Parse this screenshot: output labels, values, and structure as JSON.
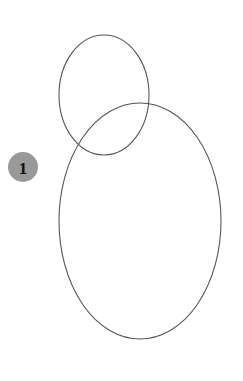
{
  "canvas": {
    "width": 243,
    "height": 381,
    "background_color": "#ffffff"
  },
  "style": {
    "outline_color": "#555555",
    "outline_width": 1.1,
    "marker_fill_color": "#999999",
    "marker_text_color": "#111111"
  },
  "shapes": [
    {
      "name": "small-ellipse",
      "type": "ellipse",
      "cx": 104,
      "cy": 95,
      "rx": 45,
      "ry": 60,
      "fill": "none",
      "stroke": "#555555"
    },
    {
      "name": "large-ellipse",
      "type": "ellipse",
      "cx": 140,
      "cy": 221,
      "rx": 81,
      "ry": 118,
      "fill": "none",
      "stroke": "#555555"
    }
  ],
  "markers": [
    {
      "name": "marker-1",
      "label": "1",
      "cx": 23,
      "cy": 167,
      "r": 15,
      "fill": "#999999"
    }
  ]
}
